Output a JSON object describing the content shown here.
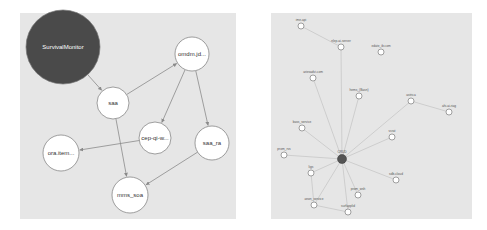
{
  "left_graph": {
    "nodes": [
      {
        "id": "survivalmonitor",
        "label": "SurvivalMonitor",
        "x": 63,
        "y": 47,
        "r": 37,
        "fill": "#4a4a4a",
        "text_color": "#ffffff"
      },
      {
        "id": "saa",
        "label": "saa",
        "x": 113,
        "y": 103,
        "r": 16,
        "fill": "#ffffff"
      },
      {
        "id": "omdm",
        "label": "omdm.jd...",
        "x": 192,
        "y": 54,
        "r": 17,
        "fill": "#ffffff"
      },
      {
        "id": "cep-qi",
        "label": "cep-qi-w...",
        "x": 155,
        "y": 138,
        "r": 16,
        "fill": "#ffffff"
      },
      {
        "id": "saa_ra",
        "label": "saa_ra",
        "x": 212,
        "y": 143,
        "r": 17,
        "fill": "#ffffff"
      },
      {
        "id": "ora-item",
        "label": "ora.item...",
        "x": 61,
        "y": 153,
        "r": 18,
        "fill": "#ffffff"
      },
      {
        "id": "mms_soa",
        "label": "mms_soa",
        "x": 130,
        "y": 195,
        "r": 18,
        "fill": "#ffffff"
      }
    ],
    "edges": [
      {
        "from": "survivalmonitor",
        "to": "saa"
      },
      {
        "from": "saa",
        "to": "omdm"
      },
      {
        "from": "omdm",
        "to": "cep-qi"
      },
      {
        "from": "omdm",
        "to": "saa_ra"
      },
      {
        "from": "cep-qi",
        "to": "ora-item"
      },
      {
        "from": "saa",
        "to": "mms_soa"
      },
      {
        "from": "saa_ra",
        "to": "mms_soa"
      }
    ]
  },
  "right_graph": {
    "nodes": [
      {
        "id": "n1",
        "label": "ime-api",
        "x": 301,
        "y": 26
      },
      {
        "id": "n2",
        "label": "nlep-ai-server",
        "x": 341,
        "y": 47
      },
      {
        "id": "n3",
        "label": "edate_ib.com",
        "x": 381,
        "y": 52
      },
      {
        "id": "n4",
        "label": "ariesadvi.com",
        "x": 313,
        "y": 78
      },
      {
        "id": "n5",
        "label": "hems_(Basn)",
        "x": 359,
        "y": 96
      },
      {
        "id": "n6",
        "label": "astrica",
        "x": 411,
        "y": 101
      },
      {
        "id": "n7",
        "label": "ahi-ai-riag",
        "x": 449,
        "y": 112
      },
      {
        "id": "n8",
        "label": "bass_service",
        "x": 302,
        "y": 128
      },
      {
        "id": "n9",
        "label": "vcrat",
        "x": 392,
        "y": 137
      },
      {
        "id": "n10",
        "label": "prom_rvs",
        "x": 284,
        "y": 155
      },
      {
        "id": "center",
        "label": "CRUD",
        "x": 342,
        "y": 159,
        "center": true
      },
      {
        "id": "n12",
        "label": "sdb-cloud",
        "x": 396,
        "y": 180
      },
      {
        "id": "n13",
        "label": "ligs",
        "x": 311,
        "y": 173
      },
      {
        "id": "n14",
        "label": "prom_wsh",
        "x": 358,
        "y": 195
      },
      {
        "id": "n15",
        "label": "anon_service",
        "x": 314,
        "y": 205
      },
      {
        "id": "n16",
        "label": "surfapplid",
        "x": 348,
        "y": 212
      }
    ],
    "edges": [
      {
        "from": "n1",
        "to": "n2"
      },
      {
        "from": "center",
        "to": "n2"
      },
      {
        "from": "center",
        "to": "n4"
      },
      {
        "from": "center",
        "to": "n5"
      },
      {
        "from": "center",
        "to": "n6"
      },
      {
        "from": "center",
        "to": "n8"
      },
      {
        "from": "center",
        "to": "n9"
      },
      {
        "from": "center",
        "to": "n10"
      },
      {
        "from": "center",
        "to": "n12"
      },
      {
        "from": "center",
        "to": "n13"
      },
      {
        "from": "center",
        "to": "n14"
      },
      {
        "from": "center",
        "to": "n15"
      },
      {
        "from": "center",
        "to": "n16"
      },
      {
        "from": "n6",
        "to": "n7"
      },
      {
        "from": "n13",
        "to": "n15"
      },
      {
        "from": "n15",
        "to": "n16"
      }
    ]
  },
  "colors": {
    "panel_bg": "#e6e6e6",
    "edge": "#8a8a8a",
    "node_stroke": "#777777",
    "center_node": "#555555"
  }
}
